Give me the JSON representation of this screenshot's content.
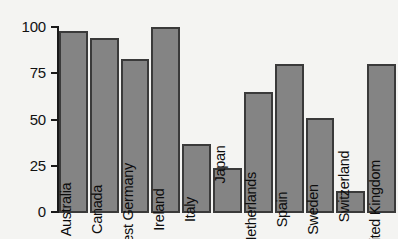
{
  "chart_data": {
    "type": "bar",
    "title": "",
    "subtitle": "",
    "xlabel": "",
    "ylabel": "",
    "ylim": [
      0,
      100
    ],
    "grid": false,
    "legend": null,
    "orientation": "vertical",
    "bar_color": "#848484",
    "bar_border_color": "#3a3a3a",
    "background_color": "#f4f4f2",
    "axis_color": "#1a1a1a",
    "label_rotation": -90,
    "label_placement": "inside-bar-bottom",
    "ytick_labels": [
      "100",
      "75",
      "50",
      "25",
      "0"
    ],
    "ytick_values": [
      100,
      75,
      50,
      25,
      0
    ],
    "categories": [
      "Australia",
      "Canada",
      "West Germany",
      "Ireland",
      "Italy",
      "Japan",
      "Netherlands",
      "Spain",
      "Sweden",
      "Switzerland",
      "United Kingdom"
    ],
    "values": [
      98,
      94,
      83,
      100,
      37,
      24,
      65,
      80,
      51,
      12,
      80
    ]
  }
}
